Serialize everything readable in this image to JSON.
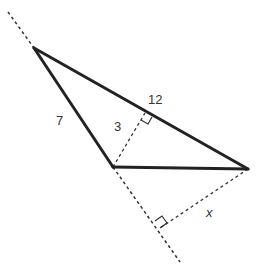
{
  "diagram": {
    "type": "geometry-triangle",
    "colors": {
      "solid_line": "#222222",
      "dashed_line": "#333333",
      "label": "#333333",
      "background": "#ffffff"
    },
    "labels": {
      "side_AB": "7",
      "side_AC": "12",
      "altitude_from_B": "3",
      "unknown_x": "x"
    },
    "annotations": [
      {
        "name": "right-angle-marker-altitude-on-AC"
      },
      {
        "name": "right-angle-marker-perpendicular-from-C"
      }
    ]
  }
}
